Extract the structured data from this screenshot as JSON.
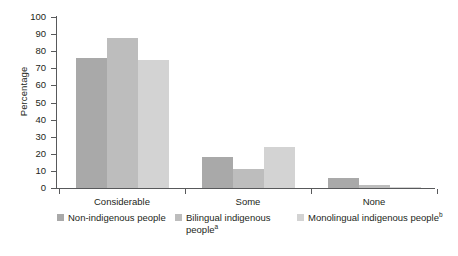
{
  "chart_data": {
    "type": "bar",
    "title": "",
    "subtitle": "",
    "xlabel": "",
    "ylabel": "Percentage",
    "categories": [
      "Considerable",
      "Some",
      "None"
    ],
    "ylim": [
      0,
      100
    ],
    "yticks": [
      0,
      10,
      20,
      30,
      40,
      50,
      60,
      70,
      80,
      90,
      100
    ],
    "grid": false,
    "legend_position": "bottom",
    "series": [
      {
        "name": "Non-indigenous people",
        "name_sup": "",
        "color": "#a9a9a9",
        "values": [
          76,
          18,
          6
        ]
      },
      {
        "name": "Bilingual indigenous people",
        "name_sup": "a",
        "color": "#bdbdbd",
        "values": [
          88,
          11,
          1.5
        ]
      },
      {
        "name": "Monolingual indigenous people",
        "name_sup": "b",
        "color": "#d3d3d3",
        "values": [
          75,
          24,
          0.5
        ]
      }
    ]
  },
  "axes": {
    "y_title": "Percentage",
    "y_tick_labels": [
      "100",
      "90",
      "80",
      "70",
      "60",
      "50",
      "40",
      "30",
      "20",
      "10",
      "0"
    ],
    "x_tick_labels": [
      "Considerable",
      "Some",
      "None"
    ]
  },
  "legend": {
    "items": [
      {
        "label": "Non-indigenous people",
        "sup": "",
        "color": "#a9a9a9"
      },
      {
        "label": "Bilingual indigenous people",
        "sup": "a",
        "color": "#bdbdbd"
      },
      {
        "label": "Monolingual indigenous people",
        "sup": "b",
        "color": "#d3d3d3"
      }
    ]
  },
  "colors": {
    "axis": "#58595b",
    "text": "#231f20",
    "background": "#ffffff"
  }
}
